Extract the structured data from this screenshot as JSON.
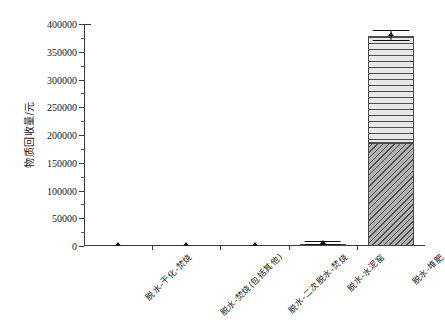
{
  "chart_data": {
    "type": "bar",
    "title": "",
    "xlabel": "",
    "ylabel": "物质回收量/元",
    "ylim": [
      0,
      400000
    ],
    "ytick_labels": [
      "0",
      "50000",
      "100000",
      "150000",
      "200000",
      "250000",
      "300000",
      "350000",
      "400000"
    ],
    "ytick_values": [
      0,
      50000,
      100000,
      150000,
      200000,
      250000,
      300000,
      350000,
      400000
    ],
    "ytick_minor_step": 25000,
    "grid": false,
    "legend": "none",
    "categories": [
      "脱水-干化-焚烧",
      "脱水-焚烧(包括其他)",
      "脱水-二次脱水-焚烧",
      "脱水-水泥窑",
      "脱水-堆肥"
    ],
    "stacked": true,
    "series": [
      {
        "name": "下部组分",
        "hatch": "diagonal",
        "values": [
          0,
          0,
          0,
          4500,
          185000
        ]
      },
      {
        "name": "上部组分",
        "hatch": "horizontal",
        "values": [
          0,
          0,
          0,
          0,
          193000
        ]
      }
    ],
    "totals": [
      0,
      0,
      0,
      4500,
      378000
    ],
    "error_markers": [
      {
        "category": "脱水-干化-焚烧",
        "value": 0,
        "error": 0
      },
      {
        "category": "脱水-焚烧(包括其他)",
        "value": 0,
        "error": 0
      },
      {
        "category": "脱水-二次脱水-焚烧",
        "value": 0,
        "error": 0
      },
      {
        "category": "脱水-水泥窑",
        "value": 4500,
        "error": 2500
      },
      {
        "category": "脱水-堆肥",
        "value": 378000,
        "error": 9000
      }
    ]
  },
  "style": {
    "axis_color": "#3a3a3a",
    "hatch_color": "#4d4d4d",
    "diagonal_fill": "#b2b2b2",
    "horizontal_fill": "#e8e8e8",
    "background": "#ffffff"
  }
}
